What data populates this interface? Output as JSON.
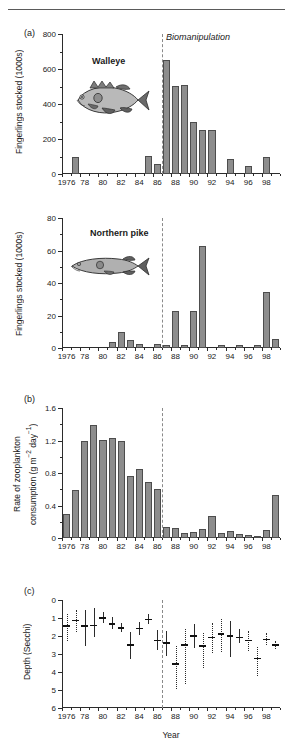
{
  "figure": {
    "panels": [
      "(a)",
      "(b)",
      "(c)"
    ],
    "xlabel": "Year",
    "annotation": "Biomanipulation",
    "annotation_year": 1986.5
  },
  "chart_data": [
    {
      "type": "bar",
      "panel": "(a)",
      "title": "Walleye",
      "series_label": "Walleye",
      "ylabel": "Fingerlings stocked (1000s)",
      "xlabel": "",
      "ylim": [
        0,
        800
      ],
      "yticks": [
        0,
        200,
        400,
        600,
        800
      ],
      "xlim": [
        1976,
        2000
      ],
      "xticks": [
        1976,
        1978,
        1980,
        1982,
        1984,
        1986,
        1988,
        1990,
        1992,
        1994,
        1996,
        1998
      ],
      "xticklabels": [
        "1976",
        "78",
        "80",
        "82",
        "84",
        "86",
        "88",
        "90",
        "92",
        "94",
        "96",
        "98"
      ],
      "categories": [
        1976,
        1977,
        1978,
        1979,
        1980,
        1981,
        1982,
        1983,
        1984,
        1985,
        1986,
        1987,
        1988,
        1989,
        1990,
        1991,
        1992,
        1993,
        1994,
        1995,
        1996,
        1997,
        1998,
        1999
      ],
      "values": [
        0,
        100,
        0,
        0,
        0,
        0,
        0,
        0,
        0,
        105,
        60,
        650,
        505,
        508,
        300,
        250,
        250,
        0,
        85,
        0,
        45,
        0,
        95,
        0
      ],
      "grid": false,
      "legend": false,
      "annotation": "Biomanipulation",
      "annotation_x": 1986.5
    },
    {
      "type": "bar",
      "panel": "(a2)",
      "title": "Northern pike",
      "series_label": "Northern pike",
      "ylabel": "Fingerlings stocked (1000s)",
      "xlabel": "",
      "ylim": [
        0,
        80
      ],
      "yticks": [
        0,
        20,
        40,
        60,
        80
      ],
      "xlim": [
        1976,
        2000
      ],
      "xticks": [
        1976,
        1978,
        1980,
        1982,
        1984,
        1986,
        1988,
        1990,
        1992,
        1994,
        1996,
        1998
      ],
      "xticklabels": [
        "1976",
        "78",
        "80",
        "82",
        "84",
        "86",
        "88",
        "90",
        "92",
        "94",
        "96",
        "98"
      ],
      "categories": [
        1976,
        1977,
        1978,
        1979,
        1980,
        1981,
        1982,
        1983,
        1984,
        1985,
        1986,
        1987,
        1988,
        1989,
        1990,
        1991,
        1992,
        1993,
        1994,
        1995,
        1996,
        1997,
        1998,
        1999
      ],
      "values": [
        0,
        0,
        0,
        0,
        0,
        3.5,
        10,
        5,
        2.5,
        0,
        2.5,
        1.8,
        23,
        2,
        23,
        62.5,
        0,
        1.8,
        0,
        1.8,
        0,
        2,
        34.5,
        5.5,
        13.5
      ],
      "grid": false,
      "legend": false,
      "annotation_x": 1986.5
    },
    {
      "type": "bar",
      "panel": "(b)",
      "title": "",
      "ylabel": "Rate of zooplankton consumption (g m⁻² day⁻¹)",
      "xlabel": "",
      "ylim": [
        0,
        1.6
      ],
      "yticks": [
        0,
        0.4,
        0.8,
        1.2,
        1.6
      ],
      "yticklabels": [
        "0",
        "0.4",
        "0.8",
        "1.2",
        "1.6"
      ],
      "xlim": [
        1976,
        2000
      ],
      "xticks": [
        1976,
        1978,
        1980,
        1982,
        1984,
        1986,
        1988,
        1990,
        1992,
        1994,
        1996,
        1998
      ],
      "xticklabels": [
        "1976",
        "78",
        "80",
        "82",
        "84",
        "86",
        "88",
        "90",
        "92",
        "94",
        "96",
        "98"
      ],
      "categories": [
        1976,
        1977,
        1978,
        1979,
        1980,
        1981,
        1982,
        1983,
        1984,
        1985,
        1986,
        1987,
        1988,
        1989,
        1990,
        1991,
        1992,
        1993,
        1994,
        1995,
        1996,
        1997,
        1998,
        1999
      ],
      "values": [
        0.29,
        0.59,
        1.2,
        1.39,
        1.21,
        1.23,
        1.2,
        0.76,
        0.85,
        0.69,
        0.6,
        0.14,
        0.12,
        0.06,
        0.08,
        0.11,
        0.27,
        0.06,
        0.09,
        0.05,
        0.04,
        0.03,
        0.1,
        0.53
      ],
      "grid": false,
      "legend": false,
      "annotation_x": 1986.5
    },
    {
      "type": "scatter",
      "panel": "(c)",
      "title": "",
      "ylabel": "Depth (Secchi)",
      "xlabel": "Year",
      "y_inverted": true,
      "ylim": [
        0,
        6
      ],
      "yticks": [
        0,
        1,
        2,
        3,
        4,
        5,
        6
      ],
      "xlim": [
        1976,
        2000
      ],
      "xticks": [
        1976,
        1978,
        1980,
        1982,
        1984,
        1986,
        1988,
        1990,
        1992,
        1994,
        1996,
        1998
      ],
      "xticklabels": [
        "1976",
        "78",
        "80",
        "82",
        "84",
        "86",
        "88",
        "90",
        "92",
        "94",
        "96",
        "98"
      ],
      "x": [
        1976,
        1977,
        1978,
        1979,
        1980,
        1981,
        1982,
        1983,
        1984,
        1985,
        1986,
        1987,
        1988,
        1989,
        1990,
        1991,
        1992,
        1993,
        1994,
        1995,
        1996,
        1997,
        1998,
        1999
      ],
      "means": [
        1.4,
        1.1,
        1.4,
        1.38,
        0.95,
        1.28,
        1.5,
        2.45,
        1.55,
        1.05,
        2.2,
        2.35,
        3.5,
        2.45,
        1.95,
        2.5,
        2.05,
        1.85,
        1.95,
        2.05,
        2.2,
        3.2,
        2.15,
        2.45
      ],
      "err_low": [
        0.75,
        0.55,
        0.55,
        0.45,
        0.65,
        0.95,
        1.25,
        1.8,
        1.2,
        0.8,
        1.65,
        1.7,
        2.55,
        1.6,
        1.35,
        1.85,
        1.3,
        1.05,
        1.15,
        1.6,
        1.7,
        2.6,
        1.85,
        2.25
      ],
      "err_high": [
        2.3,
        1.8,
        2.55,
        2.05,
        1.3,
        1.6,
        1.8,
        3.3,
        1.95,
        1.35,
        2.8,
        3.1,
        4.95,
        4.65,
        2.65,
        3.8,
        2.95,
        2.9,
        3.15,
        2.4,
        2.85,
        4.25,
        2.5,
        2.7
      ],
      "err_style": [
        "dotted",
        "dotted",
        "solid",
        "solid",
        "solid",
        "solid",
        "solid",
        "solid",
        "solid",
        "solid",
        "solid",
        "solid",
        "dotted",
        "dotted",
        "solid",
        "dotted",
        "dotted",
        "dotted",
        "solid",
        "solid",
        "dotted",
        "dotted",
        "dotted",
        "dotted"
      ],
      "grid": false,
      "legend": false,
      "annotation_x": 1986.5
    }
  ]
}
